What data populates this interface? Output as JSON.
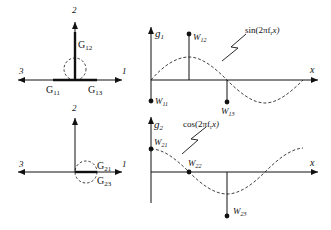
{
  "figure": {
    "top_left": {
      "axis_labels": {
        "up": "2",
        "left": "3",
        "right": "1"
      },
      "elements": [
        {
          "label": "G",
          "sub": "12"
        },
        {
          "label": "G",
          "sub": "11"
        },
        {
          "label": "G",
          "sub": "13"
        }
      ]
    },
    "bottom_left": {
      "axis_labels": {
        "up": "2",
        "left": "3",
        "right": "1"
      },
      "elements": [
        {
          "label": "G",
          "sub": "21"
        },
        {
          "label": "G",
          "sub": "23"
        }
      ]
    },
    "top_right": {
      "y_axis": {
        "label": "g",
        "sub": "1"
      },
      "x_axis": {
        "label": "x"
      },
      "curve_label": "sin(2πf",
      "curve_label_sub": "r",
      "curve_label_tail": "x)",
      "weights": [
        {
          "label": "W",
          "sub": "11"
        },
        {
          "label": "W",
          "sub": "12"
        },
        {
          "label": "W",
          "sub": "13"
        }
      ]
    },
    "bottom_right": {
      "y_axis": {
        "label": "g",
        "sub": "2"
      },
      "x_axis": {
        "label": "x"
      },
      "curve_label": "cos(2πf",
      "curve_label_sub": "r",
      "curve_label_tail": "x)",
      "weights": [
        {
          "label": "W",
          "sub": "21"
        },
        {
          "label": "W",
          "sub": "22"
        },
        {
          "label": "W",
          "sub": "23"
        }
      ]
    },
    "colors": {
      "ink": "#111111",
      "background": "#ffffff"
    }
  }
}
